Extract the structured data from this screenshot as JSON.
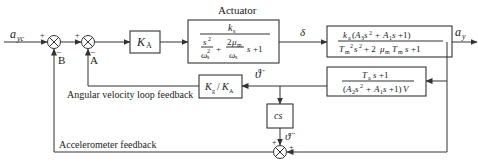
{
  "diagram": {
    "type": "control-loop block diagram",
    "input_signal": "a",
    "input_signal_sub": "yc",
    "output_signal": "a",
    "output_signal_sub": "y",
    "intermediate_signal": "δ",
    "summing_junctions": [
      {
        "id": "B",
        "label": "B",
        "signs": {
          "left": "+",
          "bottom": "−"
        }
      },
      {
        "id": "A",
        "label": "A",
        "signs": {
          "left": "+",
          "bottom": "−"
        }
      },
      {
        "id": "accel-sum",
        "signs": {
          "top": "+",
          "right": "+"
        }
      }
    ],
    "blocks": {
      "gain": {
        "main": "K",
        "sub": "A"
      },
      "actuator": {
        "title": "Actuator",
        "numerator": "k",
        "numerator_sub": "s",
        "denominator": "s²/ω_s² + (2μ_m/ω_s) s + 1"
      },
      "plant": {
        "numerator": "k_a(A_3 s² + A_1 s + 1)",
        "denominator": "T_m² s² + 2μ_m T_m s + 1"
      },
      "rate_feedback_tf": {
        "numerator": "T_a s + 1",
        "denominator": "(A_2 s² + A_1 s + 1)V"
      },
      "rate_gain": {
        "text": "K_g / K_A"
      },
      "differentiator": {
        "text": "cs"
      }
    },
    "signal_labels": {
      "theta_dot": "ϑ̇",
      "theta_ddot": "ϑ̈"
    },
    "annotations": {
      "angular_velocity_loop": "Angular velocity loop feedback",
      "accelerometer": "Accelerometer feedback"
    }
  }
}
